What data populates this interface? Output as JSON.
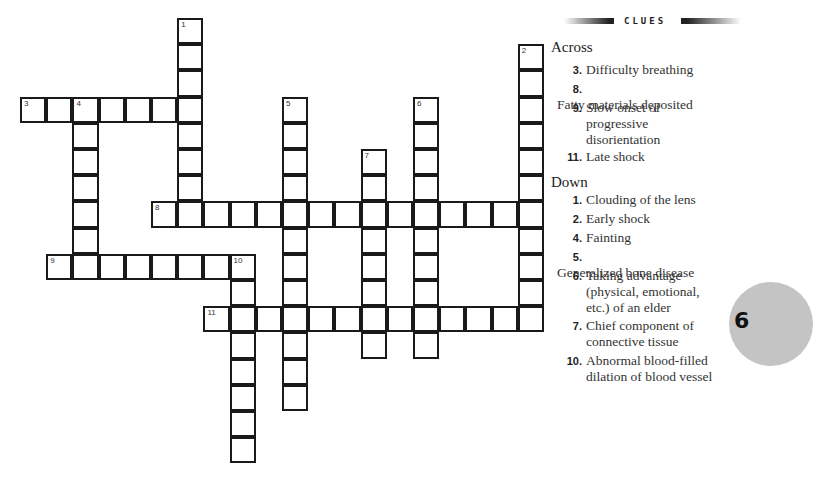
{
  "puzzle": {
    "cell_size": 26.2,
    "origin_x": 21,
    "origin_y": 19,
    "words": [
      {
        "number": 1,
        "direction": "down",
        "row": 0,
        "col": 6,
        "length": 8
      },
      {
        "number": 2,
        "direction": "down",
        "row": 1,
        "col": 19,
        "length": 11
      },
      {
        "number": 3,
        "direction": "across",
        "row": 3,
        "col": 0,
        "length": 7
      },
      {
        "number": 4,
        "direction": "down",
        "row": 3,
        "col": 2,
        "length": 7
      },
      {
        "number": 5,
        "direction": "down",
        "row": 3,
        "col": 10,
        "length": 12
      },
      {
        "number": 6,
        "direction": "down",
        "row": 3,
        "col": 15,
        "length": 10
      },
      {
        "number": 7,
        "direction": "down",
        "row": 5,
        "col": 13,
        "length": 8
      },
      {
        "number": 8,
        "direction": "across",
        "row": 7,
        "col": 5,
        "length": 15
      },
      {
        "number": 9,
        "direction": "across",
        "row": 9,
        "col": 1,
        "length": 8
      },
      {
        "number": 10,
        "direction": "down",
        "row": 9,
        "col": 8,
        "length": 8
      },
      {
        "number": 11,
        "direction": "across",
        "row": 11,
        "col": 7,
        "length": 13
      }
    ]
  },
  "clues": {
    "header": "CLUES",
    "across_title": "Across",
    "down_title": "Down",
    "across": [
      {
        "number": "3.",
        "text": "Difficulty breathing"
      },
      {
        "number": "8.",
        "text": "Fatty materials deposited"
      },
      {
        "number": "9.",
        "text": "Slow onset of progressive disorientation"
      },
      {
        "number": "11.",
        "text": "Late shock"
      }
    ],
    "down": [
      {
        "number": "1.",
        "text": "Clouding of the lens"
      },
      {
        "number": "2.",
        "text": "Early shock"
      },
      {
        "number": "4.",
        "text": "Fainting"
      },
      {
        "number": "5.",
        "text": "Generalized bone disease"
      },
      {
        "number": "6.",
        "text": "Taking advantage (physical, emotional, etc.) of an elder"
      },
      {
        "number": "7.",
        "text": "Chief component of connective tissue"
      },
      {
        "number": "10.",
        "text": "Abnormal blood-filled dilation of blood vessel"
      }
    ]
  },
  "chapter_badge": "6"
}
